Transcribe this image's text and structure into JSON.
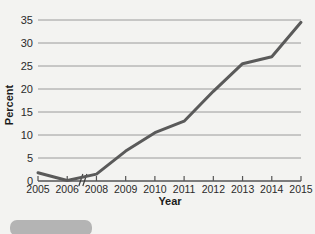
{
  "figure": {
    "background_color": "#f3f3f1",
    "bottom_bar_color": "#b4b4b4"
  },
  "chart_data": {
    "type": "line",
    "title": "",
    "xlabel": "Year",
    "ylabel": "Percent",
    "categories": [
      "2005",
      "2006",
      "2008",
      "2009",
      "2010",
      "2011",
      "2012",
      "2013",
      "2014",
      "2015"
    ],
    "values": [
      1.8,
      0.1,
      1.5,
      6.5,
      10.5,
      13,
      19.5,
      25.5,
      27,
      34.5
    ],
    "ylim": [
      0,
      35
    ],
    "ytick_labels": [
      "0",
      "5",
      "10",
      "15",
      "20",
      "25",
      "30",
      "35"
    ],
    "ytick_values": [
      0,
      5,
      10,
      15,
      20,
      25,
      30,
      35
    ],
    "xtick_labels": [
      "2005",
      "2006",
      "2008",
      "2009",
      "2010",
      "2011",
      "2012",
      "2013",
      "2014",
      "2015"
    ],
    "grid": true,
    "grid_axis": "y",
    "grid_color": "#9a9a9a",
    "legend": null,
    "legend_position": "none",
    "line_color": "#5a5a5a",
    "line_width": 3,
    "axis_break": {
      "present": true,
      "between": [
        "2006",
        "2008"
      ],
      "omitted_label": "2007",
      "symbol": "//"
    },
    "annotations": []
  }
}
